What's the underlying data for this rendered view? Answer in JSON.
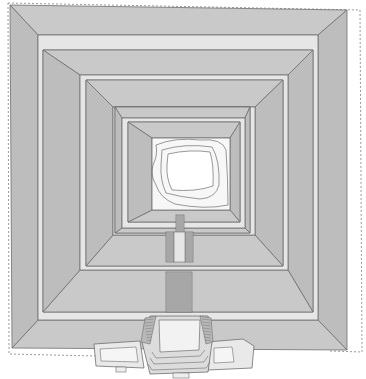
{
  "diagram": {
    "title": "Stepped pyramid plan (top view)",
    "type": "architectural-plan",
    "colors": {
      "slope": "#c9c9c9",
      "slope_dark": "#bdbdbd",
      "terrace": "#e6e6e6",
      "summit": "#f7f7f7",
      "line": "#6f6f6f",
      "boundary": "#9a9a9a",
      "stair_line": "#777777"
    },
    "tiers": [
      {
        "name": "tier-1-base",
        "outer": [
          10,
          5,
          347,
          10,
          347,
          350,
          12,
          348
        ],
        "inner": [
          38,
          35,
          318,
          35,
          318,
          320,
          38,
          320
        ]
      },
      {
        "name": "tier-2",
        "outer": [
          43,
          50,
          313,
          50,
          313,
          312,
          43,
          312
        ],
        "inner": [
          80,
          75,
          288,
          75,
          288,
          270,
          80,
          270
        ]
      },
      {
        "name": "tier-3",
        "outer": [
          86,
          80,
          283,
          80,
          283,
          266,
          86,
          266
        ],
        "inner": [
          113,
          107,
          255,
          107,
          255,
          235,
          113,
          235
        ]
      },
      {
        "name": "tier-4",
        "outer": [
          115,
          107,
          250,
          107,
          250,
          233,
          115,
          233
        ],
        "inner": [
          122,
          118,
          245,
          118,
          245,
          228,
          122,
          228
        ]
      },
      {
        "name": "tier-5",
        "outer": [
          128,
          122,
          240,
          122,
          240,
          222,
          128,
          222
        ],
        "inner": [
          152,
          138,
          230,
          138,
          230,
          210,
          152,
          210
        ]
      }
    ],
    "summit": {
      "label": "summit-temple-contours"
    },
    "stairways": [
      {
        "name": "stair-upper",
        "x": 176,
        "y": 215,
        "w": 8,
        "h": 22
      },
      {
        "name": "stair-mid-left",
        "x": 166,
        "y": 232,
        "w": 8,
        "h": 30
      },
      {
        "name": "stair-mid-right",
        "x": 185,
        "y": 232,
        "w": 8,
        "h": 30
      },
      {
        "name": "stair-lower",
        "x": 166,
        "y": 272,
        "w": 26,
        "h": 40
      }
    ],
    "entrance": {
      "label": "entrance-complex"
    }
  }
}
